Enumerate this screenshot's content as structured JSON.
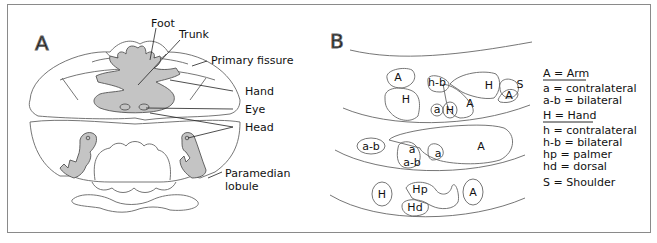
{
  "panelA": {
    "letter": "A",
    "labels": {
      "foot": "Foot",
      "trunk": "Trunk",
      "primary_fissure": "Primary fissure",
      "hand": "Hand",
      "eye": "Eye",
      "head": "Head",
      "paramedian1": "Paramedian",
      "paramedian2": "lobule"
    }
  },
  "panelB": {
    "letter": "B",
    "regions": {
      "r1_A": "A",
      "r1_H": "H",
      "r1_hb": "h-b",
      "r1_a": "a",
      "r1_H2": "H",
      "r1_A2": "A",
      "r1_H3": "H",
      "r1_S": "S",
      "r1_A3": "A",
      "r2_ab": "a-b",
      "r2_a": "a",
      "r2_ab2": "a-b",
      "r2_a2": "a",
      "r2_A": "A",
      "r3_H": "H",
      "r3_Hp": "Hp",
      "r3_Hd": "Hd",
      "r3_A": "A"
    },
    "legend": {
      "arm_heading": "A = Arm",
      "arm_items": [
        "a = contralateral",
        "a-b = bilateral"
      ],
      "hand_heading": "H = Hand",
      "hand_items": [
        "h = contralateral",
        "h-b = bilateral",
        "hp = palmer",
        "hd = dorsal"
      ],
      "shoulder": "S = Shoulder"
    }
  },
  "colors": {
    "fill": "#c4c4c4",
    "stroke": "#555555",
    "border": "#8a8a8a"
  }
}
